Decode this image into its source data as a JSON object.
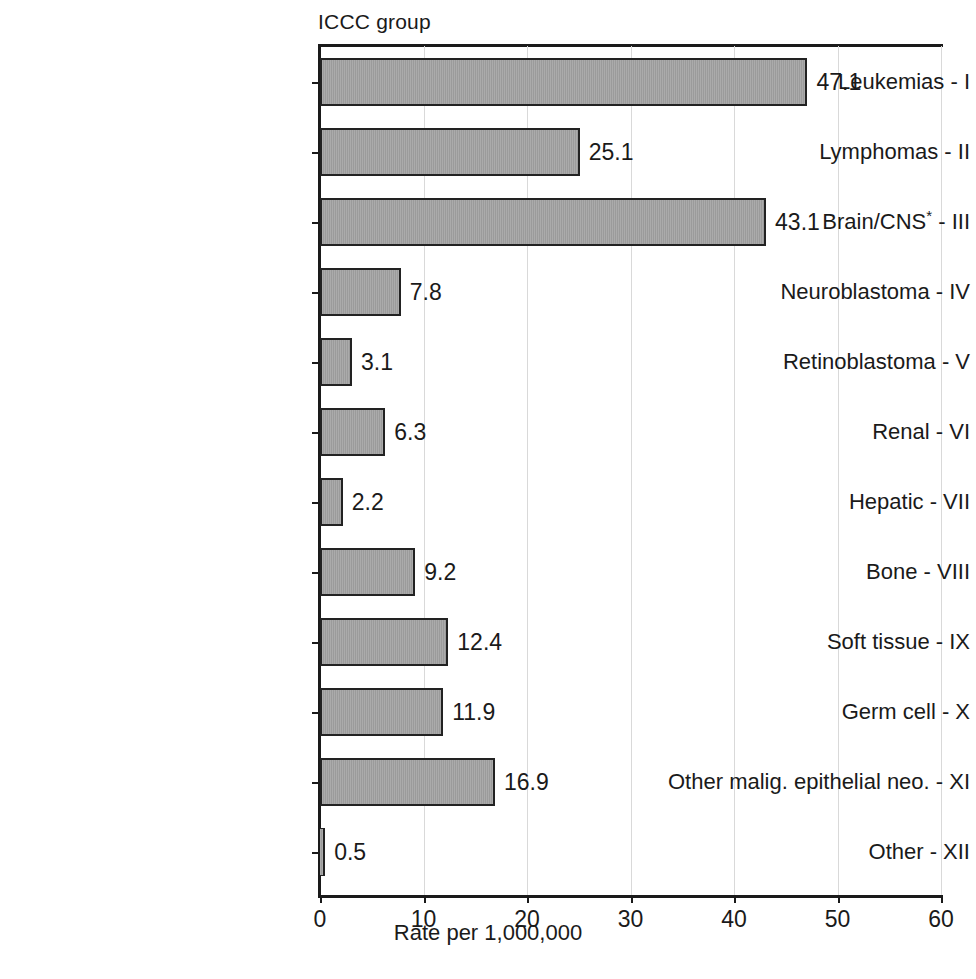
{
  "figure": {
    "group_axis_title": "ICCC group",
    "xlabel": "Rate per 1,000,000"
  },
  "chart_data": {
    "type": "bar",
    "orientation": "horizontal",
    "title": "",
    "xlabel": "Rate per 1,000,000",
    "ylabel": "ICCC group",
    "xlim": [
      0,
      60
    ],
    "xticks": [
      0,
      10,
      20,
      30,
      40,
      50,
      60
    ],
    "grid": "vertical",
    "legend": "none",
    "bar_color": "#9b9b9b",
    "bar_edge_color": "#222222",
    "footnote_marker": "*",
    "categories": [
      "Leukemias - I",
      "Lymphomas - II",
      "Brain/CNS* - III",
      "Neuroblastoma - IV",
      "Retinoblastoma - V",
      "Renal - VI",
      "Hepatic - VII",
      "Bone - VIII",
      "Soft tissue - IX",
      "Germ cell - X",
      "Other malig. epithelial neo. - XI",
      "Other - XII"
    ],
    "values": [
      47.1,
      25.1,
      43.1,
      7.8,
      3.1,
      6.3,
      2.2,
      9.2,
      12.4,
      11.9,
      16.9,
      0.5
    ],
    "value_labels": [
      "47.1",
      "25.1",
      "43.1",
      "7.8",
      "3.1",
      "6.3",
      "2.2",
      "9.2",
      "12.4",
      "11.9",
      "16.9",
      "0.5"
    ],
    "rows": [
      {
        "label_main": "Leukemias",
        "label_numeral": "I",
        "star": false,
        "label": "Leukemias - I",
        "value": 47.1,
        "value_label": "47.1"
      },
      {
        "label_main": "Lymphomas",
        "label_numeral": "II",
        "star": false,
        "label": "Lymphomas - II",
        "value": 25.1,
        "value_label": "25.1"
      },
      {
        "label_main": "Brain/CNS",
        "label_numeral": "III",
        "star": true,
        "label": "Brain/CNS* - III",
        "value": 43.1,
        "value_label": "43.1"
      },
      {
        "label_main": "Neuroblastoma",
        "label_numeral": "IV",
        "star": false,
        "label": "Neuroblastoma - IV",
        "value": 7.8,
        "value_label": "7.8"
      },
      {
        "label_main": "Retinoblastoma",
        "label_numeral": "V",
        "star": false,
        "label": "Retinoblastoma - V",
        "value": 3.1,
        "value_label": "3.1"
      },
      {
        "label_main": "Renal",
        "label_numeral": "VI",
        "star": false,
        "label": "Renal - VI",
        "value": 6.3,
        "value_label": "6.3"
      },
      {
        "label_main": "Hepatic",
        "label_numeral": "VII",
        "star": false,
        "label": "Hepatic - VII",
        "value": 2.2,
        "value_label": "2.2"
      },
      {
        "label_main": "Bone",
        "label_numeral": "VIII",
        "star": false,
        "label": "Bone - VIII",
        "value": 9.2,
        "value_label": "9.2"
      },
      {
        "label_main": "Soft tissue",
        "label_numeral": "IX",
        "star": false,
        "label": "Soft tissue - IX",
        "value": 12.4,
        "value_label": "12.4"
      },
      {
        "label_main": "Germ cell",
        "label_numeral": "X",
        "star": false,
        "label": "Germ cell - X",
        "value": 11.9,
        "value_label": "11.9"
      },
      {
        "label_main": "Other malig. epithelial neo.",
        "label_numeral": "XI",
        "star": false,
        "label": "Other malig. epithelial neo. - XI",
        "value": 16.9,
        "value_label": "16.9"
      },
      {
        "label_main": "Other",
        "label_numeral": "XII",
        "star": false,
        "label": "Other - XII",
        "value": 0.5,
        "value_label": "0.5"
      }
    ],
    "xtick_labels": [
      "0",
      "10",
      "20",
      "30",
      "40",
      "50",
      "60"
    ]
  }
}
